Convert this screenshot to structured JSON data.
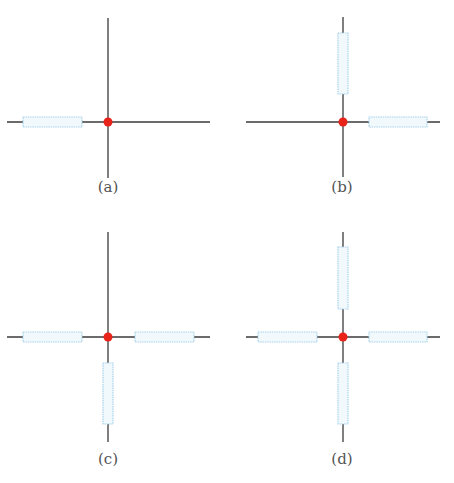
{
  "colors": {
    "wire": "#3a3a3a",
    "resistor_fill": "#f1f9fd",
    "resistor_stroke": "#a9d3ea",
    "node": "#e8231a"
  },
  "panels": [
    {
      "label": "(a)",
      "resistors": [
        "left"
      ]
    },
    {
      "label": "(b)",
      "resistors": [
        "top",
        "right"
      ]
    },
    {
      "label": "(c)",
      "resistors": [
        "left",
        "right",
        "bottom"
      ]
    },
    {
      "label": "(d)",
      "resistors": [
        "top",
        "left",
        "right",
        "bottom"
      ]
    }
  ]
}
